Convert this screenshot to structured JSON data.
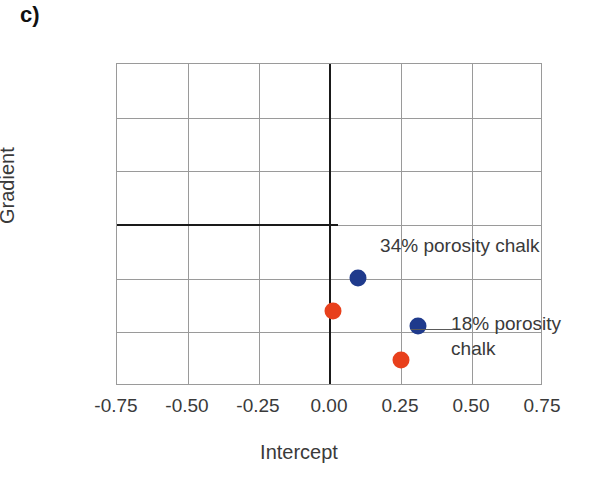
{
  "panel": {
    "label": "c)"
  },
  "chart_data": {
    "type": "scatter",
    "title": "",
    "xlabel": "Intercept",
    "ylabel": "Gradient",
    "xlim": [
      -0.75,
      0.75
    ],
    "ylim": [
      -0.75,
      0.75
    ],
    "grid": true,
    "legend_position": "inline-annotations",
    "xticks": [
      "-0.75",
      "-0.50",
      "-0.25",
      "0.00",
      "0.25",
      "0.50",
      "0.75"
    ],
    "xtick_values": [
      -0.75,
      -0.5,
      -0.25,
      0,
      0.25,
      0.5,
      0.75
    ],
    "yticks": [
      "0.75",
      "0.50",
      "0.25",
      "0.00",
      "-0.25",
      "-0.50",
      "-0.75"
    ],
    "ytick_values": [
      0.75,
      0.5,
      0.25,
      0,
      -0.25,
      -0.5,
      -0.75
    ],
    "series": [
      {
        "name": "34% porosity chalk",
        "color": "#1f3a8c",
        "points": [
          {
            "x": 0.1,
            "y": -0.245
          },
          {
            "x": 0.31,
            "y": -0.47
          }
        ]
      },
      {
        "name": "18% porosity chalk",
        "color": "#e8401c",
        "points": [
          {
            "x": 0.01,
            "y": -0.4
          },
          {
            "x": 0.25,
            "y": -0.63
          }
        ]
      }
    ],
    "annotations": [
      {
        "text": "34% porosity chalk",
        "x": 0.18,
        "y": -0.1
      },
      {
        "text": "18% porosity\nchalk",
        "x": 0.43,
        "y": -0.46
      }
    ]
  },
  "colors": {
    "blue": "#1f3a8c",
    "red": "#e8401c",
    "grid": "#9a9a9a",
    "axis": "#1a1a1a",
    "text": "#3a3a3a"
  }
}
